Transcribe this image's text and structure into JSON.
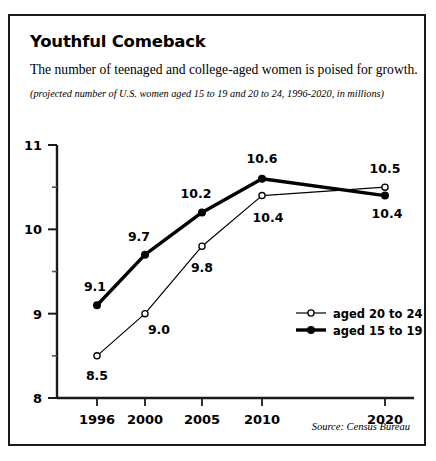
{
  "figure": {
    "title": "Youthful Comeback",
    "subtitle": "The number of teenaged and college-aged women is poised for growth.",
    "note": "(projected number of U.S. women aged 15 to 19 and 20 to 24, 1996-2020, in millions)",
    "source": "Source: Census Bureau",
    "border_color": "#1a1a1a"
  },
  "chart_data": {
    "type": "line",
    "title": "Youthful Comeback",
    "subtitle": "The number of teenaged and college-aged women is poised for growth.",
    "annotation": "(projected number of U.S. women aged 15 to 19 and 20 to 24, 1996-2020, in millions)",
    "source": "Source: Census Bureau",
    "xlabel": "",
    "ylabel": "",
    "categories": [
      "1996",
      "2000",
      "2005",
      "2010",
      "2020"
    ],
    "x": [
      1996,
      2000,
      2005,
      2010,
      2020
    ],
    "ylim": [
      8,
      11
    ],
    "xlim": [
      1996,
      2020
    ],
    "yticks": [
      "8",
      "9",
      "10",
      "11"
    ],
    "ytick_values": [
      8,
      9,
      10,
      11
    ],
    "yminor_values": [
      8.5,
      9.5,
      10.5
    ],
    "grid": false,
    "legend_position": "center-right",
    "series": [
      {
        "name": "aged 20 to 24",
        "values": [
          8.5,
          9.0,
          9.8,
          10.4,
          10.5
        ],
        "labels": [
          "8.5",
          "9.0",
          "9.8",
          "10.4",
          "10.5"
        ],
        "marker": "open-circle",
        "line_width": 1.2,
        "color": "#000000"
      },
      {
        "name": "aged 15 to 19",
        "values": [
          9.1,
          9.7,
          10.2,
          10.6,
          10.4
        ],
        "labels": [
          "9.1",
          "9.7",
          "10.2",
          "10.6",
          "10.4"
        ],
        "marker": "filled-circle",
        "line_width": 3.4,
        "color": "#000000"
      }
    ],
    "legend": [
      {
        "label": "aged 20 to 24",
        "marker": "open-circle",
        "line_width": 1.2
      },
      {
        "label": "aged 15 to 19",
        "marker": "filled-circle",
        "line_width": 3.4
      }
    ]
  }
}
